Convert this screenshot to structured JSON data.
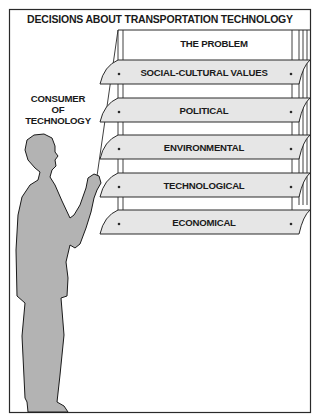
{
  "diagram": {
    "title": "DECISIONS ABOUT TRANSPORTATION TECHNOLOGY",
    "actor": {
      "label_lines": [
        "CONSUMER",
        "OF",
        "TECHNOLOGY"
      ],
      "label": "CONSUMER OF TECHNOLOGY",
      "depiction": "gray silhouette of a person pulling a cord"
    },
    "header_panel": {
      "label": "THE PROBLEM"
    },
    "slats": [
      {
        "label": "SOCIAL-CULTURAL VALUES"
      },
      {
        "label": "POLITICAL"
      },
      {
        "label": "ENVIRONMENTAL"
      },
      {
        "label": "TECHNOLOGICAL"
      },
      {
        "label": "ECONOMICAL"
      }
    ],
    "metaphor": "venetian blind with slats representing decision factors",
    "colors": {
      "frame": "#2a2a2a",
      "slat_fill": "#e6e6e6",
      "figure_fill": "#b3b3b3",
      "background": "#ffffff"
    }
  }
}
